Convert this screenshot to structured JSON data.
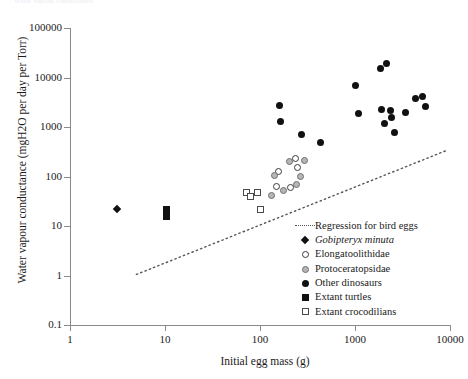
{
  "top_caption": "Water vapour conductance",
  "chart_data": {
    "type": "scatter",
    "title": "",
    "xlabel": "Initial egg mass (g)",
    "ylabel": "Water vapour conductance (mgH2O per day per Torr)",
    "xscale": "log",
    "yscale": "log",
    "xlim": [
      1,
      10000
    ],
    "ylim": [
      0.1,
      100000
    ],
    "xticks": [
      "1",
      "10",
      "100",
      "1000",
      "10000"
    ],
    "yticks": [
      "100000",
      "10000",
      "1000",
      "100",
      "10",
      "1",
      "0.1"
    ],
    "grid": false,
    "legend_position": "lower-right-inside",
    "series": [
      {
        "name": "Regression for bird eggs",
        "marker": "dotted-line",
        "color": "#555555",
        "line": {
          "x": [
            5,
            9000
          ],
          "y": [
            1.05,
            330
          ]
        }
      },
      {
        "name": "Gobipteryx minuta",
        "marker": "filled-diamond",
        "color": "#111111",
        "italic": true,
        "points": [
          {
            "x": 3.1,
            "y": 22
          }
        ]
      },
      {
        "name": "Elongatoolithidae",
        "marker": "open-circle",
        "color": "#3a3a3a",
        "points": [
          {
            "x": 95,
            "y": 47
          },
          {
            "x": 155,
            "y": 125
          },
          {
            "x": 148,
            "y": 62
          },
          {
            "x": 210,
            "y": 60
          },
          {
            "x": 235,
            "y": 235
          },
          {
            "x": 250,
            "y": 150
          }
        ]
      },
      {
        "name": "Protoceratopsidae",
        "marker": "gray-circle",
        "color": "#b6b6b6",
        "points": [
          {
            "x": 131,
            "y": 41
          },
          {
            "x": 142,
            "y": 105
          },
          {
            "x": 176,
            "y": 53
          },
          {
            "x": 205,
            "y": 205
          },
          {
            "x": 243,
            "y": 70
          },
          {
            "x": 268,
            "y": 100
          },
          {
            "x": 296,
            "y": 215
          }
        ]
      },
      {
        "name": "Other dinosaurs",
        "marker": "filled-circle",
        "color": "#111111",
        "points": [
          {
            "x": 160,
            "y": 2700
          },
          {
            "x": 163,
            "y": 1300
          },
          {
            "x": 275,
            "y": 700
          },
          {
            "x": 430,
            "y": 480
          },
          {
            "x": 1010,
            "y": 6900
          },
          {
            "x": 1100,
            "y": 1900
          },
          {
            "x": 1850,
            "y": 15000
          },
          {
            "x": 2150,
            "y": 19000
          },
          {
            "x": 1900,
            "y": 2300
          },
          {
            "x": 2050,
            "y": 1150
          },
          {
            "x": 2350,
            "y": 2150
          },
          {
            "x": 2450,
            "y": 1550
          },
          {
            "x": 2600,
            "y": 780
          },
          {
            "x": 3400,
            "y": 1950
          },
          {
            "x": 4300,
            "y": 3800
          },
          {
            "x": 5100,
            "y": 4200
          },
          {
            "x": 5500,
            "y": 2550
          }
        ]
      },
      {
        "name": "Extant turtles",
        "marker": "filled-square",
        "color": "#111111",
        "points": [
          {
            "x": 10.3,
            "y": 22
          },
          {
            "x": 10.3,
            "y": 15.5
          }
        ]
      },
      {
        "name": "Extant crocodilians",
        "marker": "open-square",
        "color": "#4a4a4a",
        "points": [
          {
            "x": 72,
            "y": 47
          },
          {
            "x": 80,
            "y": 40
          },
          {
            "x": 95,
            "y": 47
          },
          {
            "x": 102,
            "y": 22
          }
        ]
      }
    ]
  }
}
